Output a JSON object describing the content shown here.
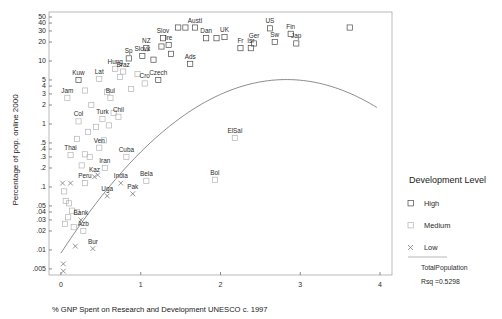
{
  "chart_data": {
    "type": "scatter",
    "title": "",
    "xlabel": "% GNP Spent on Research and Development UNESCO c. 1997",
    "ylabel": "Percentage of pop. online 2000",
    "xlim": [
      -0.15,
      4.15
    ],
    "ylim_log": [
      0.004,
      60
    ],
    "yscale": "log",
    "grid": false,
    "xticks": [
      "0",
      "1",
      "2",
      "3",
      "4"
    ],
    "xtick_values": [
      0,
      1,
      2,
      3,
      4
    ],
    "yticks": [
      "50",
      "40",
      "30",
      "20",
      "10",
      "5",
      "4",
      "3",
      "2",
      "1",
      ".5",
      ".4",
      ".3",
      ".2",
      ".1",
      ".05",
      ".04",
      ".03",
      ".02",
      ".01",
      ".005"
    ],
    "ytick_values": [
      50,
      40,
      30,
      20,
      10,
      5,
      4,
      3,
      2,
      1,
      0.5,
      0.4,
      0.3,
      0.2,
      0.1,
      0.05,
      0.04,
      0.03,
      0.02,
      0.01,
      0.005
    ],
    "legend_position": "right",
    "legend_title": "Development Level",
    "legend_entries": [
      {
        "label": "High",
        "marker": "square-open"
      },
      {
        "label": "Medium",
        "marker": "square-light"
      },
      {
        "label": "Low",
        "marker": "x-cross"
      }
    ],
    "legend_notes": [
      "TotalPopulation",
      "Rsq =0.5298"
    ],
    "fit_curve": "quadratic",
    "rsq": "0.5298",
    "points": [
      {
        "label": "Austl",
        "x": 1.68,
        "y": 34,
        "level": "High",
        "lx": 0,
        "ly": -5
      },
      {
        "label": "",
        "x": 1.47,
        "y": 34,
        "level": "High",
        "lx": 0,
        "ly": 0
      },
      {
        "label": "",
        "x": 1.56,
        "y": 34,
        "level": "High",
        "lx": 0,
        "ly": 0
      },
      {
        "label": "US",
        "x": 2.62,
        "y": 33,
        "level": "High",
        "lx": 0,
        "ly": -5
      },
      {
        "label": "",
        "x": 3.62,
        "y": 34,
        "level": "High",
        "lx": 0,
        "ly": 0
      },
      {
        "label": "Fin",
        "x": 2.88,
        "y": 27,
        "level": "High",
        "lx": 0,
        "ly": -5
      },
      {
        "label": "Slov",
        "x": 1.28,
        "y": 23,
        "level": "High",
        "lx": 0,
        "ly": -5
      },
      {
        "label": "Dan",
        "x": 1.82,
        "y": 23,
        "level": "High",
        "lx": 0,
        "ly": -5
      },
      {
        "label": "",
        "x": 1.95,
        "y": 23,
        "level": "High",
        "lx": 0,
        "ly": 0
      },
      {
        "label": "UK",
        "x": 2.05,
        "y": 24,
        "level": "High",
        "lx": 0,
        "ly": -5
      },
      {
        "label": "Ger",
        "x": 2.42,
        "y": 19,
        "level": "High",
        "lx": 0,
        "ly": -5
      },
      {
        "label": "Sw",
        "x": 2.68,
        "y": 20,
        "level": "High",
        "lx": 0,
        "ly": -5
      },
      {
        "label": "Jap",
        "x": 2.95,
        "y": 19,
        "level": "High",
        "lx": 0,
        "ly": -5
      },
      {
        "label": "Ire",
        "x": 1.35,
        "y": 18,
        "level": "High",
        "lx": 0,
        "ly": -5
      },
      {
        "label": "Fr",
        "x": 2.25,
        "y": 16,
        "level": "High",
        "lx": 0,
        "ly": -5
      },
      {
        "label": "Isr",
        "x": 2.38,
        "y": 16,
        "level": "High",
        "lx": 0,
        "ly": -5
      },
      {
        "label": "NZ",
        "x": 1.07,
        "y": 16,
        "level": "High",
        "lx": 0,
        "ly": -5
      },
      {
        "label": "Slovk",
        "x": 1.02,
        "y": 12,
        "level": "High",
        "lx": 0,
        "ly": -5
      },
      {
        "label": "Sp",
        "x": 0.85,
        "y": 11,
        "level": "High",
        "lx": 0,
        "ly": -5
      },
      {
        "label": "Hung",
        "x": 0.68,
        "y": 7.5,
        "level": "Medium",
        "lx": 0,
        "ly": -5
      },
      {
        "label": "Braz",
        "x": 0.78,
        "y": 6.8,
        "level": "Medium",
        "lx": 0,
        "ly": -5
      },
      {
        "label": "Ads",
        "x": 1.62,
        "y": 9.0,
        "level": "High",
        "lx": 0,
        "ly": -5
      },
      {
        "label": "Czech",
        "x": 1.22,
        "y": 5.0,
        "level": "High",
        "lx": 0,
        "ly": -5
      },
      {
        "label": "Cro",
        "x": 1.05,
        "y": 4.4,
        "level": "Medium",
        "lx": 0,
        "ly": -5
      },
      {
        "label": "Kuw",
        "x": 0.22,
        "y": 5.0,
        "level": "High",
        "lx": 0,
        "ly": -5
      },
      {
        "label": "Lat",
        "x": 0.48,
        "y": 5.2,
        "level": "Medium",
        "lx": 0,
        "ly": -5
      },
      {
        "label": "Jam",
        "x": 0.08,
        "y": 2.6,
        "level": "Medium",
        "lx": 0,
        "ly": -5
      },
      {
        "label": "Bul",
        "x": 0.62,
        "y": 2.6,
        "level": "Medium",
        "lx": 0,
        "ly": -5
      },
      {
        "label": "Col",
        "x": 0.22,
        "y": 1.1,
        "level": "Medium",
        "lx": 0,
        "ly": -5
      },
      {
        "label": "Turk",
        "x": 0.52,
        "y": 1.2,
        "level": "Medium",
        "lx": 0,
        "ly": -5
      },
      {
        "label": "Chil",
        "x": 0.72,
        "y": 1.3,
        "level": "Medium",
        "lx": 0,
        "ly": -5
      },
      {
        "label": "Ven",
        "x": 0.48,
        "y": 0.42,
        "level": "Medium",
        "lx": 0,
        "ly": -5
      },
      {
        "label": "Thai",
        "x": 0.12,
        "y": 0.32,
        "level": "Medium",
        "lx": 0,
        "ly": -5
      },
      {
        "label": "Cuba",
        "x": 0.82,
        "y": 0.3,
        "level": "Medium",
        "lx": 0,
        "ly": -5
      },
      {
        "label": "Iran",
        "x": 0.55,
        "y": 0.2,
        "level": "Medium",
        "lx": 0,
        "ly": -5
      },
      {
        "label": "Kaz",
        "x": 0.42,
        "y": 0.145,
        "level": "Low",
        "lx": 0,
        "ly": -5
      },
      {
        "label": "Peru",
        "x": 0.3,
        "y": 0.115,
        "level": "Medium",
        "lx": 0,
        "ly": -5
      },
      {
        "label": "India",
        "x": 0.75,
        "y": 0.115,
        "level": "Low",
        "lx": 0,
        "ly": -5
      },
      {
        "label": "Bela",
        "x": 1.07,
        "y": 0.125,
        "level": "Medium",
        "lx": 0,
        "ly": -5
      },
      {
        "label": "Bol",
        "x": 1.93,
        "y": 0.13,
        "level": "Medium",
        "lx": 0,
        "ly": -5
      },
      {
        "label": "ElSal",
        "x": 2.18,
        "y": 0.6,
        "level": "Medium",
        "lx": 0,
        "ly": -5
      },
      {
        "label": "Uga",
        "x": 0.58,
        "y": 0.072,
        "level": "Low",
        "lx": 0,
        "ly": -5
      },
      {
        "label": "Pak",
        "x": 0.9,
        "y": 0.078,
        "level": "Low",
        "lx": 0,
        "ly": -5
      },
      {
        "label": "Bank",
        "x": 0.25,
        "y": 0.03,
        "level": "Low",
        "lx": 0,
        "ly": -5
      },
      {
        "label": "Azb",
        "x": 0.28,
        "y": 0.02,
        "level": "Medium",
        "lx": 0,
        "ly": -5
      },
      {
        "label": "Bur",
        "x": 0.4,
        "y": 0.0105,
        "level": "Low",
        "lx": 0,
        "ly": -5
      },
      {
        "label": "",
        "x": 0.18,
        "y": 0.0115,
        "level": "Low",
        "lx": 0,
        "ly": 0
      },
      {
        "label": "",
        "x": 0.03,
        "y": 0.006,
        "level": "Low",
        "lx": 0,
        "ly": 0
      },
      {
        "label": "",
        "x": 0.03,
        "y": 0.0046,
        "level": "Low",
        "lx": 0,
        "ly": 0
      },
      {
        "label": "",
        "x": 0.02,
        "y": 0.115,
        "level": "Low",
        "lx": 0,
        "ly": 0
      },
      {
        "label": "",
        "x": 0.04,
        "y": 0.085,
        "level": "Medium",
        "lx": 0,
        "ly": 0
      },
      {
        "label": "",
        "x": 0.06,
        "y": 0.06,
        "level": "Medium",
        "lx": 0,
        "ly": 0
      },
      {
        "label": "",
        "x": 0.1,
        "y": 0.055,
        "level": "Medium",
        "lx": 0,
        "ly": 0
      },
      {
        "label": "",
        "x": 0.14,
        "y": 0.042,
        "level": "Medium",
        "lx": 0,
        "ly": 0
      },
      {
        "label": "",
        "x": 0.09,
        "y": 0.033,
        "level": "Medium",
        "lx": 0,
        "ly": 0
      },
      {
        "label": "",
        "x": 0.05,
        "y": 0.026,
        "level": "Medium",
        "lx": 0,
        "ly": 0
      },
      {
        "label": "",
        "x": 0.2,
        "y": 0.04,
        "level": "Medium",
        "lx": 0,
        "ly": 0
      },
      {
        "label": "",
        "x": 0.16,
        "y": 0.023,
        "level": "Medium",
        "lx": 0,
        "ly": 0
      },
      {
        "label": "",
        "x": 0.3,
        "y": 0.33,
        "level": "Medium",
        "lx": 0,
        "ly": 0
      },
      {
        "label": "",
        "x": 0.26,
        "y": 0.22,
        "level": "Medium",
        "lx": 0,
        "ly": 0
      },
      {
        "label": "",
        "x": 0.36,
        "y": 0.3,
        "level": "Medium",
        "lx": 0,
        "ly": 0
      },
      {
        "label": "",
        "x": 0.2,
        "y": 0.58,
        "level": "Medium",
        "lx": 0,
        "ly": 0
      },
      {
        "label": "",
        "x": 0.34,
        "y": 0.75,
        "level": "Medium",
        "lx": 0,
        "ly": 0
      },
      {
        "label": "",
        "x": 0.44,
        "y": 0.9,
        "level": "Medium",
        "lx": 0,
        "ly": 0
      },
      {
        "label": "",
        "x": 0.6,
        "y": 0.95,
        "level": "Medium",
        "lx": 0,
        "ly": 0
      },
      {
        "label": "",
        "x": 0.66,
        "y": 1.5,
        "level": "Medium",
        "lx": 0,
        "ly": 0
      },
      {
        "label": "",
        "x": 0.58,
        "y": 3.2,
        "level": "Medium",
        "lx": 0,
        "ly": 0
      },
      {
        "label": "",
        "x": 0.3,
        "y": 3.4,
        "level": "Medium",
        "lx": 0,
        "ly": 0
      },
      {
        "label": "",
        "x": 0.38,
        "y": 2.0,
        "level": "Medium",
        "lx": 0,
        "ly": 0
      },
      {
        "label": "",
        "x": 0.88,
        "y": 3.6,
        "level": "Medium",
        "lx": 0,
        "ly": 0
      },
      {
        "label": "",
        "x": 0.96,
        "y": 6.2,
        "level": "Medium",
        "lx": 0,
        "ly": 0
      },
      {
        "label": "",
        "x": 0.74,
        "y": 5.6,
        "level": "Medium",
        "lx": 0,
        "ly": 0
      },
      {
        "label": "",
        "x": 1.16,
        "y": 10.5,
        "level": "High",
        "lx": 0,
        "ly": 0
      },
      {
        "label": "",
        "x": 1.38,
        "y": 13.0,
        "level": "High",
        "lx": 0,
        "ly": 0
      },
      {
        "label": "",
        "x": 1.26,
        "y": 17.0,
        "level": "High",
        "lx": 0,
        "ly": 0
      },
      {
        "label": "",
        "x": 0.54,
        "y": 0.55,
        "level": "Medium",
        "lx": 0,
        "ly": 0
      },
      {
        "label": "",
        "x": 0.46,
        "y": 0.155,
        "level": "Low",
        "lx": 0,
        "ly": 0
      },
      {
        "label": "",
        "x": 0.12,
        "y": 0.115,
        "level": "Low",
        "lx": 0,
        "ly": 0
      }
    ]
  }
}
